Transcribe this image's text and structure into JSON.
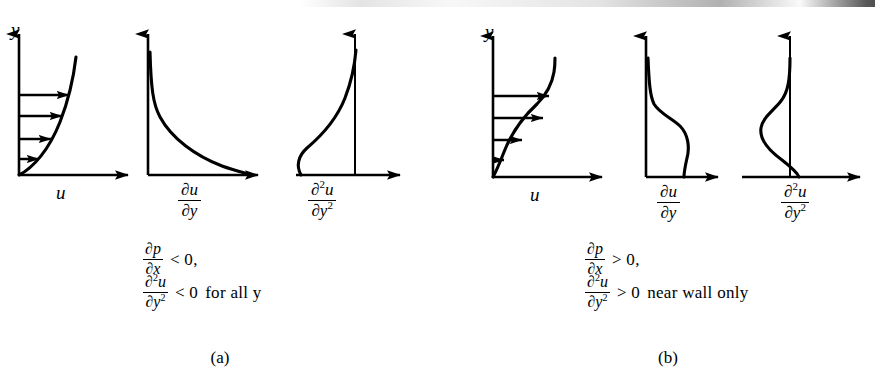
{
  "figure": {
    "type": "scientific-diagram"
  },
  "panels": [
    {
      "id": "a",
      "caption": "(a)",
      "charts": [
        {
          "name": "velocity-profile",
          "y_axis_label": "y",
          "x_axis_label": "u",
          "description": "concave velocity profile, no inflection point, four horizontal velocity arrows increasing in length with height"
        },
        {
          "name": "first-derivative",
          "x_axis_label_num": "∂u",
          "x_axis_label_den": "∂y",
          "description": "monotonically decreasing positive curve, maximum at wall decaying toward zero"
        },
        {
          "name": "second-derivative",
          "x_axis_label_num": "∂²u",
          "x_axis_label_den": "∂y²",
          "description": "entirely negative curve left of the vertical axis, approaching zero at the top"
        }
      ],
      "conditions": [
        {
          "frac_num": "∂p",
          "frac_den": "∂x",
          "relation": "< 0,",
          "qualifier": ""
        },
        {
          "frac_num": "∂²u",
          "frac_den": "∂y²",
          "relation": "< 0",
          "qualifier": "for  all  y"
        }
      ]
    },
    {
      "id": "b",
      "caption": "(b)",
      "charts": [
        {
          "name": "velocity-profile",
          "y_axis_label": "y",
          "x_axis_label": "u",
          "description": "S-shaped velocity profile with an inflection point, four horizontal velocity arrows"
        },
        {
          "name": "first-derivative",
          "x_axis_label_num": "∂u",
          "x_axis_label_den": "∂y",
          "description": "positive curve with an interior bulge and a local minimum, zero at the wall region"
        },
        {
          "name": "second-derivative",
          "x_axis_label_num": "∂²u",
          "x_axis_label_den": "∂y²",
          "description": "curve crossing the vertical axis: positive near the wall, negative farther out"
        }
      ],
      "conditions": [
        {
          "frac_num": "∂p",
          "frac_den": "∂x",
          "relation": "> 0,",
          "qualifier": ""
        },
        {
          "frac_num": "∂²u",
          "frac_den": "∂y²",
          "relation": "> 0",
          "qualifier": "near  wall  only"
        }
      ]
    }
  ],
  "chart_data": {
    "type": "line",
    "title": "",
    "xlabel": "",
    "ylabel": "y",
    "grid": false,
    "legend": false,
    "panels": [
      {
        "panel": "a",
        "caption": "(a)",
        "pressure_gradient_sign": "negative",
        "series": [
          {
            "name": "u (velocity profile)",
            "xlabel": "u",
            "ylabel": "y",
            "orientation": "y-vertical",
            "points": [
              {
                "y": 0.0,
                "x": 0.0
              },
              {
                "y": 0.12,
                "x": 0.14
              },
              {
                "y": 0.25,
                "x": 0.28
              },
              {
                "y": 0.4,
                "x": 0.45
              },
              {
                "y": 0.55,
                "x": 0.6
              },
              {
                "y": 0.7,
                "x": 0.74
              },
              {
                "y": 0.85,
                "x": 0.86
              },
              {
                "y": 1.0,
                "x": 0.96
              }
            ],
            "arrows": [
              0.18,
              0.38,
              0.58,
              0.78
            ]
          },
          {
            "name": "du/dy",
            "xlabel": "∂u/∂y",
            "points": [
              {
                "y": 1.0,
                "x": 0.02
              },
              {
                "y": 0.85,
                "x": 0.04
              },
              {
                "y": 0.7,
                "x": 0.07
              },
              {
                "y": 0.55,
                "x": 0.13
              },
              {
                "y": 0.4,
                "x": 0.22
              },
              {
                "y": 0.25,
                "x": 0.4
              },
              {
                "y": 0.12,
                "x": 0.66
              },
              {
                "y": 0.0,
                "x": 1.0
              }
            ]
          },
          {
            "name": "d2u/dy2",
            "xlabel": "∂²u/∂y²",
            "sign": "negative everywhere",
            "points": [
              {
                "y": 0.0,
                "x": -0.95
              },
              {
                "y": 0.1,
                "x": -1.0
              },
              {
                "y": 0.22,
                "x": -0.88
              },
              {
                "y": 0.38,
                "x": -0.68
              },
              {
                "y": 0.55,
                "x": -0.46
              },
              {
                "y": 0.72,
                "x": -0.26
              },
              {
                "y": 0.88,
                "x": -0.1
              },
              {
                "y": 1.0,
                "x": 0.0
              }
            ]
          }
        ]
      },
      {
        "panel": "b",
        "caption": "(b)",
        "pressure_gradient_sign": "positive",
        "series": [
          {
            "name": "u (velocity profile)",
            "xlabel": "u",
            "ylabel": "y",
            "orientation": "y-vertical",
            "inflection_point_y": 0.45,
            "points": [
              {
                "y": 0.0,
                "x": 0.0
              },
              {
                "y": 0.1,
                "x": 0.05
              },
              {
                "y": 0.22,
                "x": 0.13
              },
              {
                "y": 0.35,
                "x": 0.3
              },
              {
                "y": 0.48,
                "x": 0.52
              },
              {
                "y": 0.62,
                "x": 0.7
              },
              {
                "y": 0.78,
                "x": 0.85
              },
              {
                "y": 0.92,
                "x": 0.94
              },
              {
                "y": 1.0,
                "x": 0.98
              }
            ],
            "arrows": [
              0.12,
              0.35,
              0.58,
              0.78
            ]
          },
          {
            "name": "du/dy",
            "xlabel": "∂u/∂y",
            "points": [
              {
                "y": 1.0,
                "x": 0.03
              },
              {
                "y": 0.86,
                "x": 0.05
              },
              {
                "y": 0.72,
                "x": 0.12
              },
              {
                "y": 0.6,
                "x": 0.3
              },
              {
                "y": 0.5,
                "x": 0.52
              },
              {
                "y": 0.4,
                "x": 0.66
              },
              {
                "y": 0.28,
                "x": 0.7
              },
              {
                "y": 0.16,
                "x": 0.6
              },
              {
                "y": 0.06,
                "x": 0.38
              },
              {
                "y": 0.0,
                "x": 0.22
              }
            ]
          },
          {
            "name": "d2u/dy2",
            "xlabel": "∂²u/∂y²",
            "sign": "positive near wall, negative outside",
            "zero_crossing_y": 0.4,
            "points": [
              {
                "y": 0.0,
                "x": 0.55
              },
              {
                "y": 0.12,
                "x": 0.72
              },
              {
                "y": 0.25,
                "x": 0.55
              },
              {
                "y": 0.4,
                "x": 0.0
              },
              {
                "y": 0.52,
                "x": -0.42
              },
              {
                "y": 0.64,
                "x": -0.6
              },
              {
                "y": 0.76,
                "x": -0.45
              },
              {
                "y": 0.88,
                "x": -0.16
              },
              {
                "y": 1.0,
                "x": 0.0
              }
            ]
          }
        ]
      }
    ]
  }
}
